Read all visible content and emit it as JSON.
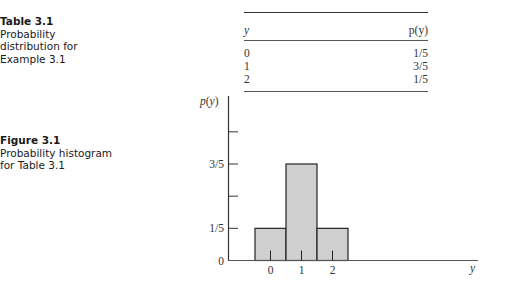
{
  "table_caption": {
    "title": "Table 3.1",
    "description": "Probability\ndistribution for\nExample 3.1"
  },
  "figure_caption": {
    "title": "Figure 3.1",
    "description": "Probability histogram\nfor Table 3.1"
  },
  "table": {
    "columns": [
      "y",
      "p(y)"
    ],
    "rows": [
      {
        "y": "0",
        "p": "1/5"
      },
      {
        "y": "1",
        "p": "3/5"
      },
      {
        "y": "2",
        "p": "1/5"
      }
    ]
  },
  "chart_data": {
    "type": "bar",
    "title": "Probability histogram for Table 3.1",
    "categories": [
      "0",
      "1",
      "2"
    ],
    "values": [
      0.2,
      0.6,
      0.2
    ],
    "value_labels": [
      "1/5",
      "3/5",
      "1/5"
    ],
    "xlabel": "y",
    "ylabel": "p(y)",
    "yticks": [
      0,
      0.2,
      0.4,
      0.6,
      0.8
    ],
    "ytick_labels": [
      "0",
      "1/5",
      "",
      "3/5",
      ""
    ],
    "ylim": [
      0,
      0.8
    ],
    "grid": false,
    "legend": null,
    "bar_fill": "#cfcfcf",
    "bar_edge": "#222222",
    "bar_width": 1.0
  }
}
